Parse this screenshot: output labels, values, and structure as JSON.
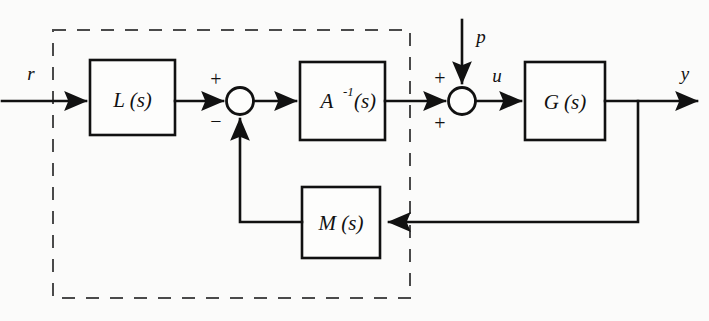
{
  "diagram": {
    "background_color": "#fbfbfa",
    "line_color": "#111111",
    "dashed_color": "#4a4a4a"
  },
  "blocks": [
    {
      "id": "L",
      "label": "L (s)",
      "base": "L",
      "sup": "",
      "arg": "(s)"
    },
    {
      "id": "Ainv",
      "label": "A",
      "base": "A",
      "sup": "-1",
      "arg": "(s)"
    },
    {
      "id": "G",
      "label": "G (s)",
      "base": "G",
      "sup": "",
      "arg": "(s)"
    },
    {
      "id": "M",
      "label": "M (s)",
      "base": "M",
      "sup": "",
      "arg": "(s)"
    }
  ],
  "signals": {
    "reference": "r",
    "disturbance": "p",
    "control": "u",
    "output": "y"
  },
  "summing_junctions": [
    {
      "id": "sum1",
      "signs": [
        "+",
        "-"
      ]
    },
    {
      "id": "sum2",
      "signs": [
        "+",
        "+"
      ]
    }
  ],
  "signs": {
    "sum1_plus": "+",
    "sum1_minus": "−",
    "sum2_plus_top": "+",
    "sum2_plus_bottom": "+"
  }
}
